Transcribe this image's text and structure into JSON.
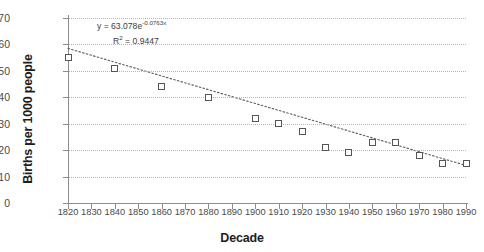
{
  "chart_data": {
    "type": "scatter",
    "title": "",
    "xlabel": "Decade",
    "ylabel": "Births per 1000 people",
    "xlim": [
      1820,
      1990
    ],
    "ylim": [
      0,
      70
    ],
    "ytick_step": 10,
    "grid": true,
    "legend": false,
    "categories": [
      1820,
      1830,
      1840,
      1850,
      1860,
      1870,
      1880,
      1890,
      1900,
      1910,
      1920,
      1930,
      1940,
      1950,
      1960,
      1970,
      1980,
      1990
    ],
    "xticklabels": [
      "1820",
      "1830",
      "1840",
      "1850",
      "1860",
      "1870",
      "1880",
      "1890",
      "1900",
      "1910",
      "1920",
      "1930",
      "1940",
      "1950",
      "1960",
      "1970",
      "1980",
      "1990"
    ],
    "yticklabels": [
      "0",
      "10",
      "20",
      "30",
      "40",
      "50",
      "60",
      "70"
    ],
    "yticks": [
      0,
      10,
      20,
      30,
      40,
      50,
      60,
      70
    ],
    "points": [
      {
        "x": 1820,
        "y": 55
      },
      {
        "x": 1840,
        "y": 51
      },
      {
        "x": 1860,
        "y": 44
      },
      {
        "x": 1880,
        "y": 40
      },
      {
        "x": 1900,
        "y": 32
      },
      {
        "x": 1910,
        "y": 30
      },
      {
        "x": 1920,
        "y": 27
      },
      {
        "x": 1930,
        "y": 21
      },
      {
        "x": 1940,
        "y": 19
      },
      {
        "x": 1950,
        "y": 23
      },
      {
        "x": 1960,
        "y": 23
      },
      {
        "x": 1970,
        "y": 18
      },
      {
        "x": 1980,
        "y": 15
      },
      {
        "x": 1990,
        "y": 15
      }
    ],
    "series": [
      {
        "name": "Births per 1000 people",
        "marker": "open-square",
        "values": [
          55,
          null,
          51,
          null,
          44,
          null,
          40,
          null,
          32,
          30,
          27,
          21,
          19,
          23,
          23,
          18,
          15,
          15
        ]
      }
    ],
    "trendline": {
      "type": "exponential",
      "style": "dotted",
      "equation_prefix": "y = 63.078e",
      "equation_exponent": "-0.0763x",
      "r_label": "R",
      "r_superscript": "2",
      "r_equals": " = 0.9447",
      "coefficient": 63.078,
      "rate": -0.0763,
      "r_squared": 0.9447,
      "endpoints": [
        {
          "x": 1820,
          "y": 58.5
        },
        {
          "x": 1990,
          "y": 14.2
        }
      ]
    },
    "annotations": [
      {
        "name": "equation-annotation",
        "text": "y = 63.078e-0.0763x"
      },
      {
        "name": "r-squared-annotation",
        "text": "R2 = 0.9447"
      }
    ],
    "colors": {
      "marker_stroke": "#555555",
      "marker_fill": "#ffffff",
      "axis": "#8d8d8d",
      "grid": "#b6b6b6",
      "text": "#3a3a3a",
      "title_text": "#1d1d1d"
    }
  }
}
